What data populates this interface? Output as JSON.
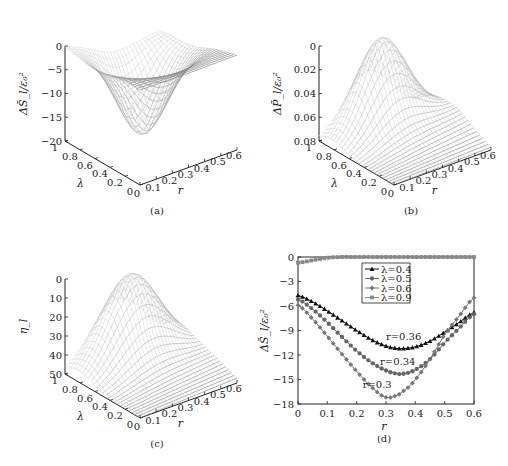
{
  "figure": {
    "panels": [
      {
        "id": "a",
        "caption": "(a)"
      },
      {
        "id": "b",
        "caption": "(b)"
      },
      {
        "id": "c",
        "caption": "(c)"
      },
      {
        "id": "d",
        "caption": "(d)"
      }
    ]
  },
  "chart_data": [
    {
      "panel": "a",
      "type": "surface3d",
      "caption": "(a)",
      "zlabel": "ΔS̄_l/ε₀²",
      "xlabel": "r",
      "ylabel": "λ",
      "x_ticks": [
        "0",
        "0.1",
        "0.2",
        "0.3",
        "0.4",
        "0.5",
        "0.6"
      ],
      "y_ticks": [
        "0",
        "0.2",
        "0.4",
        "0.6",
        "0.8",
        "1"
      ],
      "z_ticks": [
        "0",
        "−5",
        "−10",
        "−15",
        "−20"
      ],
      "xlim": [
        0,
        0.6
      ],
      "ylim": [
        0,
        1
      ],
      "zlim": [
        -20,
        0
      ],
      "description": "Mesh surface with a valley reaching about −17.5 near r≈0.3, λ≈0.6; near 0 at small λ and large r"
    },
    {
      "panel": "b",
      "type": "surface3d",
      "caption": "(b)",
      "zlabel": "ΔP̄_l/ε₀²",
      "xlabel": "r",
      "ylabel": "λ",
      "x_ticks": [
        "0",
        "0.1",
        "0.2",
        "0.3",
        "0.4",
        "0.5",
        "0.6"
      ],
      "y_ticks": [
        "0",
        "0.2",
        "0.4",
        "0.6",
        "0.8",
        "1"
      ],
      "z_ticks": [
        "0",
        "0.02",
        "0.04",
        "0.06",
        "0.08"
      ],
      "xlim": [
        0,
        0.6
      ],
      "ylim": [
        0,
        1
      ],
      "zlim": [
        0,
        0.08
      ],
      "description": "Mesh surface with a peak of about 0.075 near r≈0.3, λ≈0.8"
    },
    {
      "panel": "c",
      "type": "surface3d",
      "caption": "(c)",
      "zlabel": "η_l",
      "xlabel": "r",
      "ylabel": "λ",
      "x_ticks": [
        "0",
        "0.1",
        "0.2",
        "0.3",
        "0.4",
        "0.5",
        "0.6"
      ],
      "y_ticks": [
        "0",
        "0.2",
        "0.4",
        "0.6",
        "0.8",
        "1"
      ],
      "z_ticks": [
        "0",
        "10",
        "20",
        "30",
        "40",
        "50"
      ],
      "xlim": [
        0,
        0.6
      ],
      "ylim": [
        0,
        1
      ],
      "zlim": [
        0,
        50
      ],
      "description": "Mesh surface with a peak of about 45 near r≈0.3, λ≈0.8"
    },
    {
      "panel": "d",
      "type": "line",
      "caption": "(d)",
      "xlabel": "r",
      "ylabel": "ΔS̄_l/ε₀²",
      "xlim": [
        0,
        0.6
      ],
      "ylim": [
        -18,
        0
      ],
      "x_ticks": [
        "0",
        "0.1",
        "0.2",
        "0.3",
        "0.4",
        "0.5",
        "0.6"
      ],
      "y_ticks": [
        "0",
        "−3",
        "−6",
        "−9",
        "−12",
        "−15",
        "−18"
      ],
      "x": [
        0,
        0.05,
        0.1,
        0.15,
        0.2,
        0.25,
        0.3,
        0.34,
        0.36,
        0.4,
        0.45,
        0.5,
        0.55,
        0.6
      ],
      "series": [
        {
          "name": "λ=0.4",
          "marker": "triangle",
          "color": "#111111",
          "values": [
            -4.7,
            -5.5,
            -6.6,
            -7.8,
            -9.0,
            -10.1,
            -10.9,
            -11.2,
            -11.2,
            -11.0,
            -10.3,
            -9.2,
            -8.0,
            -6.8
          ]
        },
        {
          "name": "λ=0.5",
          "marker": "circle",
          "color": "#666666",
          "values": [
            -5.2,
            -6.4,
            -8.0,
            -9.8,
            -11.5,
            -12.9,
            -13.9,
            -14.3,
            -14.3,
            -13.8,
            -12.5,
            -10.5,
            -8.7,
            -7.0
          ]
        },
        {
          "name": "λ=0.6",
          "marker": "diamond",
          "color": "#777777",
          "values": [
            -5.9,
            -7.6,
            -9.7,
            -11.9,
            -14.0,
            -15.9,
            -17.2,
            -16.9,
            -16.4,
            -15.0,
            -12.5,
            -9.5,
            -7.2,
            -5.0
          ]
        },
        {
          "name": "λ=0.9",
          "marker": "square",
          "color": "#888888",
          "values": [
            -0.7,
            -0.4,
            -0.1,
            0,
            0,
            0,
            0,
            0,
            0,
            0,
            0,
            0,
            0,
            0
          ]
        }
      ],
      "annotations": [
        {
          "text": "r=0.36",
          "x": 0.36,
          "y": -10.2
        },
        {
          "text": "r=0.34",
          "x": 0.34,
          "y": -13.2
        },
        {
          "text": "r=0.3",
          "x": 0.27,
          "y": -16.0
        }
      ],
      "legend": {
        "position": "upper center",
        "entries": [
          "λ=0.4",
          "λ=0.5",
          "λ=0.6",
          "λ=0.9"
        ]
      }
    }
  ]
}
